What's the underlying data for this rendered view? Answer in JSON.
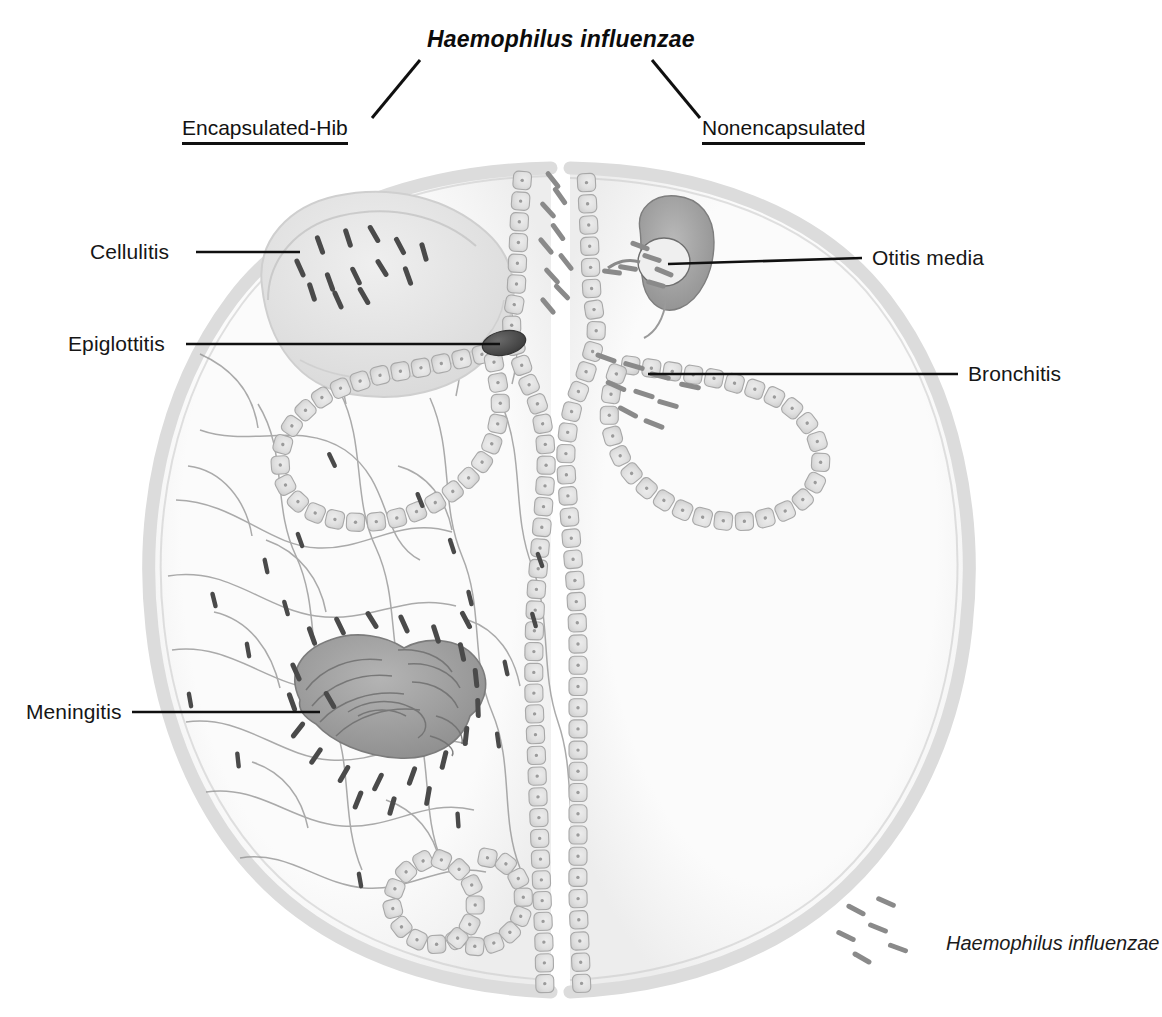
{
  "figure": {
    "title": "Haemophilus influenzae",
    "branches": [
      {
        "label": "Encapsulated-Hib",
        "side": "left"
      },
      {
        "label": "Nonencapsulated",
        "side": "right"
      }
    ],
    "labels": [
      {
        "text": "Cellulitis",
        "side": "left",
        "x": 90,
        "y": 240
      },
      {
        "text": "Epiglottitis",
        "side": "left",
        "x": 68,
        "y": 333
      },
      {
        "text": "Meningitis",
        "side": "left",
        "x": 26,
        "y": 700
      },
      {
        "text": "Otitis media",
        "side": "right",
        "x": 872,
        "y": 245
      },
      {
        "text": "Bronchitis",
        "side": "right",
        "x": 968,
        "y": 362
      }
    ],
    "legend": {
      "text": "Haemophilus influenzae",
      "symbol": "bacilli-dashes",
      "count": 6
    },
    "colors": {
      "text": "#161616",
      "leader_line": "#101010",
      "skull_rim": "#dcdcdc",
      "tissue_line": "#8c8c8c",
      "epithelial_fill": "#d2d2d2",
      "epithelial_stroke": "#a6a6a6",
      "bacteria_dark": "#4a4a4a",
      "bacteria_mid": "#8a8a8a",
      "brain": "#9a9a9a",
      "epiglottis": "#4d4d4d",
      "cellulitis_blob": "#e2e2e2",
      "background": "#ffffff"
    },
    "anatomy": [
      {
        "name": "head-outline-left",
        "role": "encapsulated-half"
      },
      {
        "name": "head-outline-right",
        "role": "nonencapsulated-half"
      },
      {
        "name": "cellulitis-swelling",
        "role": "facial soft-tissue swelling with bacteria"
      },
      {
        "name": "epiglottis",
        "role": "dark swollen epiglottis at airway inlet"
      },
      {
        "name": "brain",
        "role": "brain with meningeal bacteria"
      },
      {
        "name": "tissue-network",
        "role": "connective tissue / vessel network (left half only)"
      },
      {
        "name": "middle-ear",
        "role": "tympanic cavity containing bacteria"
      },
      {
        "name": "bronchus",
        "role": "branching airway lined with epithelium"
      },
      {
        "name": "epithelium",
        "role": "chains of epithelial cells lining airways"
      }
    ]
  }
}
